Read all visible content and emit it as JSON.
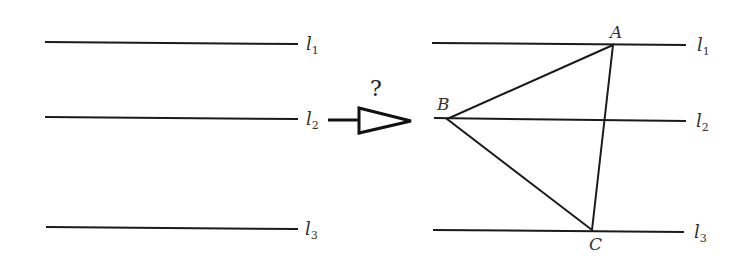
{
  "diagram": {
    "left_panel": {
      "lines": [
        {
          "name": "l",
          "sub": "1"
        },
        {
          "name": "l",
          "sub": "2"
        },
        {
          "name": "l",
          "sub": "3"
        }
      ]
    },
    "arrow": {
      "label": "?"
    },
    "right_panel": {
      "lines": [
        {
          "name": "l",
          "sub": "1"
        },
        {
          "name": "l",
          "sub": "2"
        },
        {
          "name": "l",
          "sub": "3"
        }
      ],
      "vertices": {
        "A": "A",
        "B": "B",
        "C": "C"
      }
    },
    "colors": {
      "stroke": "#1a1a1a",
      "label": "#333333",
      "background": "#ffffff"
    }
  }
}
